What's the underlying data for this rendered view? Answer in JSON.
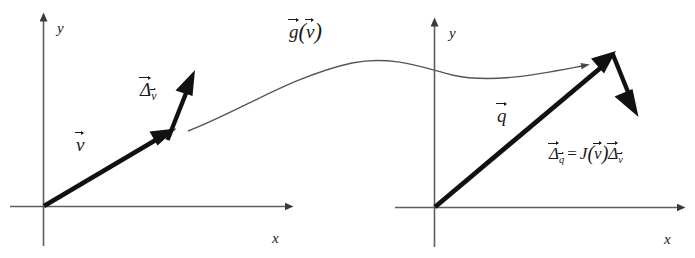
{
  "figure": {
    "background_color": "#ffffff",
    "axis_color": "#5e5e5e",
    "vector_color": "#111111",
    "curve_color": "#555555",
    "left_plot": {
      "axis_x_label": "x",
      "axis_y_label": "y",
      "vector_label": "v",
      "delta_label": "Δ",
      "delta_subscript": "v"
    },
    "right_plot": {
      "axis_x_label": "x",
      "axis_y_label": "y",
      "vector_label": "q",
      "delta_label": "Δ",
      "delta_subscript": "q"
    },
    "mapping": {
      "function_label": "g",
      "function_argument": "v"
    },
    "equation": {
      "lhs_symbol": "Δ",
      "lhs_subscript": "q",
      "equals": "=",
      "jacobian_symbol": "J",
      "jacobian_argument": "v",
      "rhs_symbol": "Δ",
      "rhs_subscript": "v",
      "open_paren": "(",
      "close_paren": ")"
    }
  }
}
